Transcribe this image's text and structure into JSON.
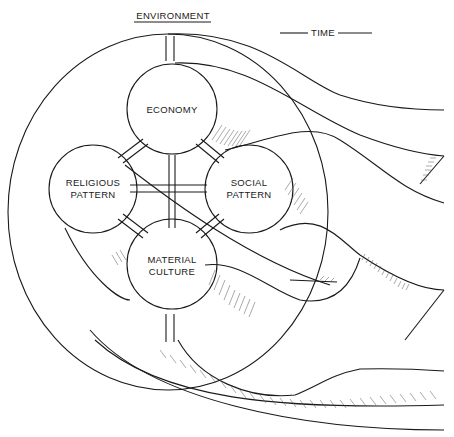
{
  "diagram": {
    "header": {
      "environment_label": "ENVIRONMENT",
      "time_label": "TIME"
    },
    "nodes": [
      {
        "id": "economy",
        "lines": [
          "ECONOMY"
        ]
      },
      {
        "id": "religious",
        "lines": [
          "RELIGIOUS",
          "PATTERN"
        ]
      },
      {
        "id": "social",
        "lines": [
          "SOCIAL",
          "PATTERN"
        ]
      },
      {
        "id": "material",
        "lines": [
          "MATERIAL",
          "CULTURE"
        ]
      }
    ],
    "colors": {
      "ink": "#1a1a1a",
      "paper": "#ffffff"
    }
  }
}
